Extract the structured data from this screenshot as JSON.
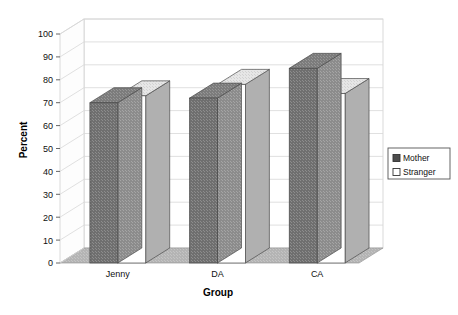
{
  "chart_data": {
    "type": "bar",
    "title": "",
    "subtitle": "",
    "xlabel": "Group",
    "ylabel": "Percent",
    "categories": [
      "Jenny",
      "DA",
      "CA"
    ],
    "series": [
      {
        "name": "Mother",
        "values": [
          70,
          72,
          85
        ],
        "color": "#6b6b6b"
      },
      {
        "name": "Stranger",
        "values": [
          73,
          78,
          74
        ],
        "color": "#ffffff"
      }
    ],
    "ylim": [
      0,
      100
    ],
    "yticks": [
      0,
      10,
      20,
      30,
      40,
      50,
      60,
      70,
      80,
      90,
      100
    ],
    "ytick_labels": [
      "0",
      "10",
      "20",
      "30",
      "40",
      "50",
      "60",
      "70",
      "80",
      "90",
      "100"
    ],
    "grid": true,
    "grid_axis": "y",
    "legend_position": "right",
    "style": "3d-column",
    "background": "#ffffff",
    "floor_color": "#b5b5b5",
    "gridline_color": "#d8d8d8"
  },
  "legend": {
    "items": [
      {
        "label": "Mother",
        "swatch": "filled-square-icon"
      },
      {
        "label": "Stranger",
        "swatch": "empty-square-icon"
      }
    ]
  },
  "axes": {
    "y_title": "Percent",
    "x_title": "Group"
  }
}
